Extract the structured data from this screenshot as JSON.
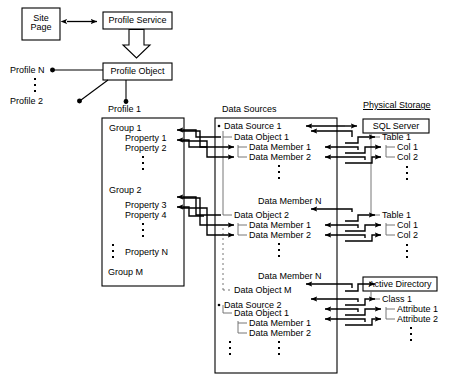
{
  "diagram": {
    "boxes": {
      "site_page": "Site\nPage",
      "site_page_line1": "Site",
      "site_page_line2": "Page",
      "profile_service": "Profile Service",
      "profile_object": "Profile Object",
      "sql_server": "SQL Server",
      "active_directory": "Active Directory"
    },
    "headers": {
      "data_sources": "Data Sources",
      "physical_storage": "Physical Storage",
      "profile_1": "Profile 1"
    },
    "profiles": {
      "profile_n": "Profile N",
      "profile_2": "Profile 2"
    },
    "profile_box": {
      "group_1": "Group 1",
      "property_1": "Property 1",
      "property_2": "Property 2",
      "group_2": "Group 2",
      "property_3": "Property 3",
      "property_4": "Property 4",
      "property_n": "Property N",
      "group_m": "Group M"
    },
    "data_sources_box": {
      "data_source_1": "Data Source 1",
      "ds1_object_1": "Data Object 1",
      "ds1_o1_member_1": "Data Member 1",
      "ds1_o1_member_2": "Data Member 2",
      "ds1_o1_member_n": "Data Member N",
      "ds1_object_2": "Data Object 2",
      "ds1_o2_member_1": "Data Member 1",
      "ds1_o2_member_2": "Data Member 2",
      "ds1_o2_member_n": "Data Member N",
      "ds1_object_m": "Data Object M",
      "data_source_2": "Data Source 2",
      "ds2_object_1": "Data Object 1",
      "ds2_o1_member_1": "Data Member 1",
      "ds2_o1_member_2": "Data Member 2"
    },
    "physical_storage_box": {
      "table_1_a": "Table 1",
      "t1a_col_1": "Col 1",
      "t1a_col_2": "Col 2",
      "table_1_b": "Table 1",
      "t1b_col_1": "Col 1",
      "t1b_col_2": "Col 2",
      "class_1": "Class 1",
      "attribute_1": "Attribute 1",
      "attribute_2": "Attribute 2"
    },
    "colors": {
      "stroke": "#000000",
      "background": "#ffffff",
      "tree_line": "#555555"
    }
  }
}
